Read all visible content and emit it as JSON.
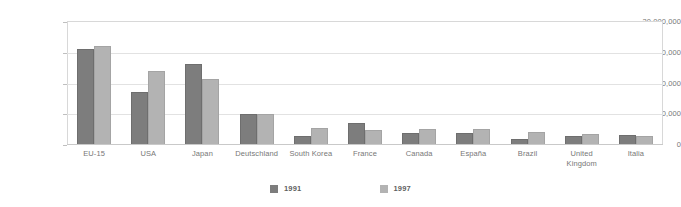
{
  "chart_data": {
    "type": "bar",
    "title": "",
    "xlabel": "",
    "ylabel": "",
    "ylim": [
      0,
      20000000
    ],
    "grid": true,
    "legend_position": "bottom-center",
    "ytick_labels": [
      "20,000,000",
      "15,000,000",
      "10,000,000",
      "5,000,000",
      "0"
    ],
    "ytick_values": [
      20000000,
      15000000,
      10000000,
      5000000,
      0
    ],
    "categories": [
      "EU-15",
      "USA",
      "Japan",
      "Deutschland",
      "South Korea",
      "France",
      "Canada",
      "España",
      "Brazil",
      "United Kingdom",
      "Italia"
    ],
    "series": [
      {
        "name": "1991",
        "color": "#7d7d7d",
        "values": [
          15600000,
          8700000,
          13100000,
          5000000,
          1500000,
          3600000,
          1900000,
          2000000,
          1000000,
          1400000,
          1600000
        ]
      },
      {
        "name": "1997",
        "color": "#b3b3b3",
        "values": [
          16100000,
          12000000,
          10800000,
          5000000,
          2800000,
          2400000,
          2600000,
          2600000,
          2100000,
          1800000,
          1500000
        ]
      }
    ]
  },
  "legend": {
    "entries": [
      {
        "label": "1991",
        "color": "#7d7d7d"
      },
      {
        "label": "1997",
        "color": "#b3b3b3"
      }
    ]
  }
}
